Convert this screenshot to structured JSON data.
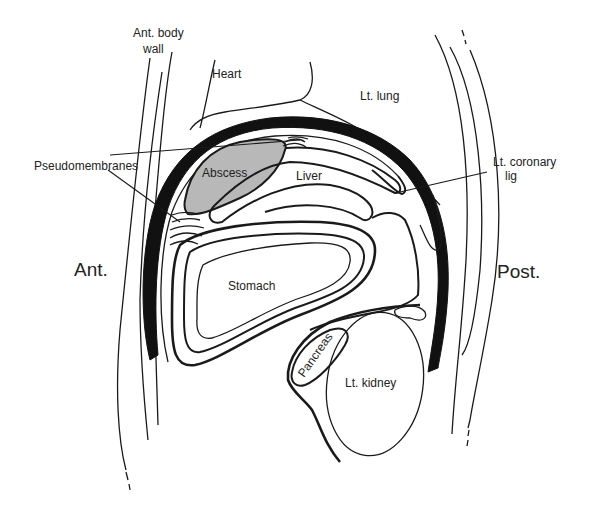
{
  "diagram": {
    "type": "anatomical sagittal section",
    "colors": {
      "line": "#1a1a1a",
      "diaphragm": "#111111",
      "abscess_fill": "#b8b8b8",
      "background": "#ffffff"
    },
    "labels": {
      "ant_body_wall_line1": "Ant. body",
      "ant_body_wall_line2": "wall",
      "heart": "Heart",
      "lt_lung": "Lt. lung",
      "pseudomembranes": "Pseudomembranes",
      "abscess": "Abscess",
      "liver": "Liver",
      "lt_coronary_lig_line1": "Lt. coronary",
      "lt_coronary_lig_line2": "lig",
      "ant": "Ant.",
      "post": "Post.",
      "stomach": "Stomach",
      "pancreas": "Pancreas",
      "lt_kidney": "Lt. kidney"
    },
    "nodes": [
      {
        "id": "ant_body_wall",
        "label": "Ant. body wall"
      },
      {
        "id": "heart",
        "label": "Heart"
      },
      {
        "id": "lt_lung",
        "label": "Lt. lung"
      },
      {
        "id": "pseudomembranes",
        "label": "Pseudomembranes"
      },
      {
        "id": "abscess",
        "label": "Abscess"
      },
      {
        "id": "liver",
        "label": "Liver"
      },
      {
        "id": "lt_coronary_lig",
        "label": "Lt. coronary lig"
      },
      {
        "id": "stomach",
        "label": "Stomach"
      },
      {
        "id": "pancreas",
        "label": "Pancreas"
      },
      {
        "id": "lt_kidney",
        "label": "Lt. kidney"
      }
    ],
    "orientation": {
      "left": "Ant.",
      "right": "Post."
    }
  }
}
